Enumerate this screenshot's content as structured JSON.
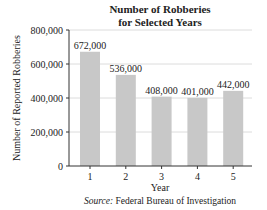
{
  "chart_data": {
    "type": "bar",
    "title": "Number of Robberies",
    "subtitle": "for Selected Years",
    "xlabel": "Year",
    "ylabel": "Number of Reported Robberies",
    "categories": [
      "1",
      "2",
      "3",
      "4",
      "5"
    ],
    "values": [
      672000,
      536000,
      408000,
      401000,
      442000
    ],
    "data_labels": [
      "672,000",
      "536,000",
      "408,000",
      "401,000",
      "442,000"
    ],
    "ylim": [
      0,
      800000
    ],
    "yticks": [
      0,
      200000,
      400000,
      600000,
      800000
    ],
    "ytick_labels": [
      "0",
      "200,000",
      "400,000",
      "600,000",
      "800,000"
    ],
    "grid": true,
    "bar_color": "#c8c8c8",
    "grid_color": "#dcdcdc",
    "source_prefix": "Source:",
    "source_text": " Federal Bureau of Investigation"
  }
}
